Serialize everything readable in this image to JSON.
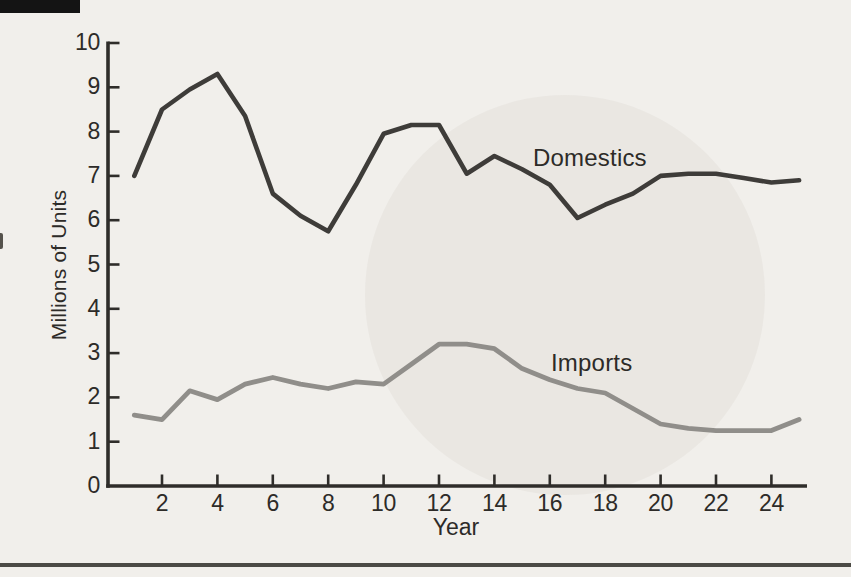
{
  "style": {
    "page_background": "#f1efeb",
    "text_color": "#2d2b28",
    "axis_color": "#2f2d2a",
    "top_bar_color": "#141414",
    "bottom_rule_color": "#4b4a45"
  },
  "chart_data": {
    "type": "line",
    "title": "",
    "xlabel": "Year",
    "ylabel": "Millions of Units",
    "xlim": [
      0,
      25.7
    ],
    "ylim": [
      0,
      10
    ],
    "x_ticks": [
      2,
      4,
      6,
      8,
      10,
      12,
      14,
      16,
      18,
      20,
      22,
      24
    ],
    "y_ticks": [
      0,
      1,
      2,
      3,
      4,
      5,
      6,
      7,
      8,
      9,
      10
    ],
    "grid": false,
    "legend_position": "inline-labels-on-chart",
    "x": [
      1,
      2,
      3,
      4,
      5,
      6,
      7,
      8,
      9,
      10,
      11,
      12,
      13,
      14,
      15,
      16,
      17,
      18,
      19,
      20,
      21,
      22,
      23,
      24,
      25
    ],
    "series": [
      {
        "name": "Domestics",
        "color": "#3e3c39",
        "line_width": 4.6,
        "values": [
          7.0,
          8.5,
          8.95,
          9.3,
          8.35,
          6.6,
          6.1,
          5.75,
          6.8,
          7.95,
          8.15,
          8.15,
          7.05,
          7.45,
          7.15,
          6.8,
          6.05,
          6.35,
          6.6,
          7.0,
          7.05,
          7.05,
          6.95,
          6.85,
          6.9
        ]
      },
      {
        "name": "Imports",
        "color": "#908e8a",
        "line_width": 4.8,
        "values": [
          1.6,
          1.5,
          2.15,
          1.95,
          2.3,
          2.45,
          2.3,
          2.2,
          2.35,
          2.3,
          2.75,
          3.2,
          3.2,
          3.1,
          2.65,
          2.4,
          2.2,
          2.1,
          1.75,
          1.4,
          1.3,
          1.25,
          1.25,
          1.25,
          1.5
        ]
      }
    ]
  }
}
